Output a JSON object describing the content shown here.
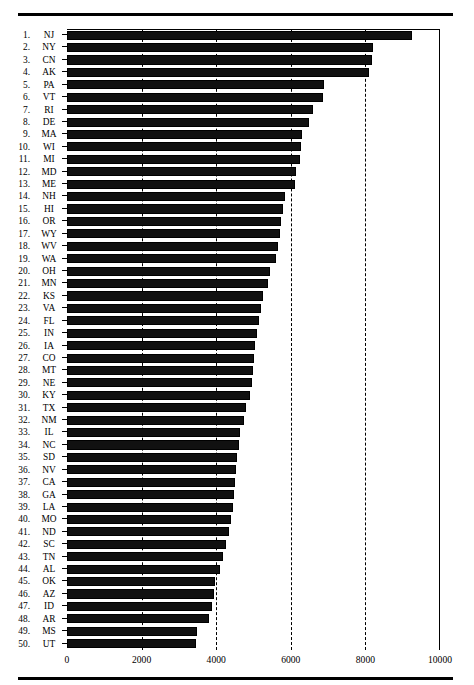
{
  "chart_data": {
    "type": "bar",
    "orientation": "horizontal",
    "title": "",
    "xlabel": "",
    "ylabel": "",
    "xlim": [
      0,
      10000
    ],
    "xticks": [
      0,
      2000,
      4000,
      6000,
      8000,
      10000
    ],
    "xticklabels": [
      "0",
      "2000",
      "4000",
      "6000",
      "8000",
      "10000"
    ],
    "grid": "vertical-dashed",
    "legend": "none",
    "bar_color": "#111111",
    "categories": [
      "NJ",
      "NY",
      "CN",
      "AK",
      "PA",
      "VT",
      "RI",
      "DE",
      "MA",
      "WI",
      "MI",
      "MD",
      "ME",
      "NH",
      "HI",
      "OR",
      "WY",
      "WV",
      "WA",
      "OH",
      "MN",
      "KS",
      "VA",
      "FL",
      "IN",
      "IA",
      "CO",
      "MT",
      "NE",
      "KY",
      "TX",
      "NM",
      "IL",
      "NC",
      "SD",
      "NV",
      "CA",
      "GA",
      "LA",
      "MO",
      "ND",
      "SC",
      "TN",
      "AL",
      "OK",
      "AZ",
      "ID",
      "AR",
      "MS",
      "UT"
    ],
    "ranks": [
      "1.",
      "2.",
      "3.",
      "4.",
      "5.",
      "6.",
      "7.",
      "8.",
      "9.",
      "10.",
      "11.",
      "12.",
      "13.",
      "14.",
      "15.",
      "16.",
      "17.",
      "18.",
      "19.",
      "20.",
      "21.",
      "22.",
      "23.",
      "24.",
      "25.",
      "26.",
      "27.",
      "28.",
      "29.",
      "30.",
      "31.",
      "32.",
      "33.",
      "34.",
      "35.",
      "36.",
      "37.",
      "38.",
      "39.",
      "40.",
      "41.",
      "42.",
      "43.",
      "44.",
      "45.",
      "46.",
      "47.",
      "48.",
      "49.",
      "50."
    ],
    "values": [
      9250,
      8200,
      8180,
      8100,
      6900,
      6850,
      6600,
      6500,
      6300,
      6280,
      6250,
      6150,
      6100,
      5850,
      5800,
      5750,
      5700,
      5650,
      5600,
      5450,
      5400,
      5250,
      5200,
      5150,
      5100,
      5050,
      5000,
      4980,
      4950,
      4900,
      4800,
      4750,
      4650,
      4600,
      4560,
      4520,
      4500,
      4480,
      4450,
      4400,
      4350,
      4250,
      4180,
      4100,
      3980,
      3950,
      3900,
      3820,
      3480,
      3450
    ],
    "series_name": ""
  }
}
